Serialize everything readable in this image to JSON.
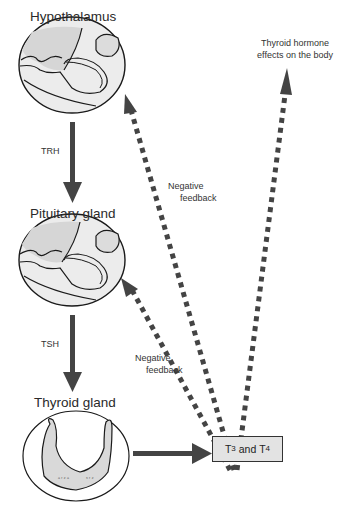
{
  "diagram": {
    "nodes": {
      "hypothalamus": {
        "label": "Hypothalamus"
      },
      "pituitary": {
        "label": "Pituitary gland"
      },
      "thyroid": {
        "label": "Thyroid gland"
      },
      "hormones": {
        "t3": "T",
        "t3_sub": "3",
        "and": " and ",
        "t4": "T",
        "t4_sub": "4"
      },
      "effects": {
        "line1": "Thyroid hormone",
        "line2": "effects on the body"
      }
    },
    "edges": {
      "trh": {
        "label": "TRH",
        "from": "Hypothalamus",
        "to": "Pituitary gland",
        "style": "solid"
      },
      "tsh": {
        "label": "TSH",
        "from": "Pituitary gland",
        "to": "Thyroid gland",
        "style": "solid"
      },
      "secretion": {
        "from": "Thyroid gland",
        "to": "T3 and T4",
        "style": "solid"
      },
      "feedback_upper": {
        "line1": "Negative",
        "line2": "feedback",
        "from": "T3 and T4",
        "to": "Hypothalamus",
        "style": "dotted"
      },
      "feedback_lower": {
        "line1": "Negative",
        "line2": "feedback",
        "from": "T3 and T4",
        "to": "Pituitary gland",
        "style": "dotted"
      },
      "effects": {
        "from": "T3 and T4",
        "to": "Thyroid hormone effects on the body",
        "style": "dotted"
      }
    },
    "colors": {
      "arrow": "#444444",
      "gland_fill": "#d9d9d9",
      "box_fill": "#e3e3e3",
      "outline": "#1a1a1a"
    }
  }
}
